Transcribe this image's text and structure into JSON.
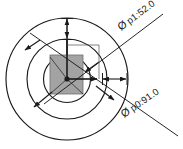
{
  "drawing": {
    "title": "Concentric circle cross-section with diameter callouts",
    "background_color": "#ffffff",
    "line_color": "#1a1a1a",
    "square_fill_color": "#a3a3a3",
    "square_stroke_color": "#4d4d4d",
    "annotations": [
      {
        "id": "p1",
        "symbol": "Ø",
        "label": "p1:52.0",
        "full_text": "Ø p1:52.0",
        "parameter": "p1",
        "value": "52.0",
        "position": "upper-right",
        "refers_to": "inner-circle"
      },
      {
        "id": "p0",
        "symbol": "Ø",
        "label": "p0:91.0",
        "full_text": "Ø p0:91.0",
        "parameter": "p0",
        "value": "91.0",
        "position": "lower-right",
        "refers_to": "outer-circle"
      }
    ],
    "geometry": {
      "center": {
        "x": 67,
        "y": 79
      },
      "outer_circle": {
        "cx": 67,
        "cy": 79,
        "r": 61
      },
      "mid_circle": {
        "cx": 67,
        "cy": 79,
        "r": 40
      },
      "inner_circle": {
        "cx": 67,
        "cy": 79,
        "r": 24
      },
      "square": {
        "x": 50,
        "y": 55,
        "width": 33,
        "height": 39
      }
    },
    "dimension_arrows": [
      {
        "id": "vertical-top",
        "orientation": "vertical",
        "from": "outer-top",
        "to": "center"
      },
      {
        "id": "horizontal-right",
        "orientation": "horizontal",
        "from": "center",
        "to": "outer-right"
      }
    ],
    "leader_lines": [
      {
        "id": "leader-p1",
        "angle_label": "upper-right-diagonal"
      },
      {
        "id": "leader-p0",
        "angle_label": "lower-right-diagonal"
      }
    ]
  }
}
